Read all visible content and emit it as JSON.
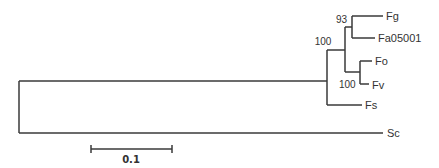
{
  "figure": {
    "type": "phylogenetic-tree",
    "leaves": [
      {
        "id": "fg",
        "label": "Fg",
        "y": 16,
        "x_end": 383
      },
      {
        "id": "fa",
        "label": "Fa05001",
        "y": 38,
        "x_end": 375
      },
      {
        "id": "fo",
        "label": "Fo",
        "y": 61,
        "x_end": 372
      },
      {
        "id": "fv",
        "label": "Fv",
        "y": 84,
        "x_end": 369
      },
      {
        "id": "fs",
        "label": "Fs",
        "y": 105,
        "x_end": 362
      },
      {
        "id": "sc",
        "label": "Sc",
        "y": 133,
        "x_end": 383
      }
    ],
    "support_values": [
      {
        "node": "fg-fa",
        "label": "93"
      },
      {
        "node": "fg-fa-fo-fv",
        "label": "100"
      },
      {
        "node": "fo-fv",
        "label": "100"
      }
    ],
    "scale_bar": {
      "label": "0.1",
      "x1": 91,
      "x2": 172,
      "y": 149
    }
  }
}
